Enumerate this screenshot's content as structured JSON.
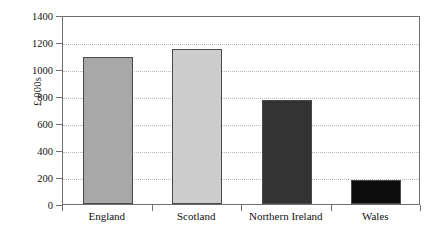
{
  "chart_data": {
    "type": "bar",
    "title": "",
    "xlabel": "",
    "ylabel": "£ 000s",
    "categories": [
      "England",
      "Scotland",
      "Northern Ireland",
      "Wales"
    ],
    "values": [
      1090,
      1150,
      770,
      175
    ],
    "ylim": [
      0,
      1400
    ],
    "ytick_step": 200,
    "yticks": [
      0,
      200,
      400,
      600,
      800,
      1000,
      1200,
      1400
    ],
    "ytick_labels": [
      "0",
      "200",
      "400",
      "600",
      "800",
      "1000",
      "1200",
      "1400"
    ],
    "grid": true,
    "grid_style": "dotted",
    "legend": "none",
    "bar_colors": [
      "#a8a8a8",
      "#cdcdcd",
      "#333333",
      "#0d0d0d"
    ],
    "bar_edge_color": "#4a4a4a",
    "frame_color": "#6f6f6f",
    "grid_color": "#b9b9b9",
    "background": "#ffffff",
    "series": [
      {
        "name": "£ 000s",
        "values": [
          1090,
          1150,
          770,
          175
        ]
      }
    ]
  }
}
